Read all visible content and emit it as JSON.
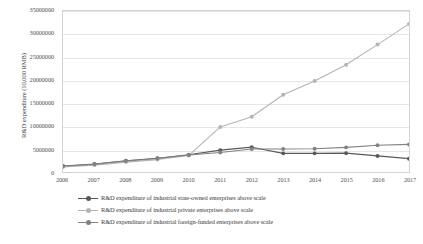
{
  "chart_data": {
    "type": "line",
    "title": "",
    "xlabel": "",
    "ylabel": "R&D expenditure (10,000 RMB)",
    "categories": [
      "2006",
      "2007",
      "2008",
      "2009",
      "2010",
      "2011",
      "2012",
      "2013",
      "2014",
      "2015",
      "2016",
      "2017"
    ],
    "ylim": [
      0,
      35000000
    ],
    "yticks": [
      "0",
      "5000000",
      "10000000",
      "15000000",
      "20000000",
      "25000000",
      "30000000",
      "35000000"
    ],
    "ytick_values": [
      0,
      5000000,
      10000000,
      15000000,
      20000000,
      25000000,
      30000000,
      35000000
    ],
    "grid": true,
    "legend_position": "bottom",
    "series": [
      {
        "name": "R&D expenditure of industrial state-owned enterprises above scale",
        "color": "#595959",
        "marker": "circle",
        "values": [
          1300000,
          1750000,
          2450000,
          3000000,
          3750000,
          4750000,
          5400000,
          4050000,
          4050000,
          4100000,
          3500000,
          2900000
        ]
      },
      {
        "name": "R&D expenditure of industrial private enterprises above scale",
        "color": "#b4b4b4",
        "marker": "circle",
        "values": [
          1100000,
          1500000,
          2150000,
          2700000,
          3600000,
          9800000,
          12000000,
          16800000,
          19800000,
          23300000,
          27700000,
          32200000
        ]
      },
      {
        "name": "R&D expenditure of industrial foreign-funded enterprises above scale",
        "color": "#828282",
        "marker": "circle",
        "values": [
          1250000,
          1700000,
          2400000,
          2950000,
          3700000,
          4250000,
          5000000,
          5000000,
          5050000,
          5350000,
          5800000,
          6000000
        ]
      }
    ]
  }
}
